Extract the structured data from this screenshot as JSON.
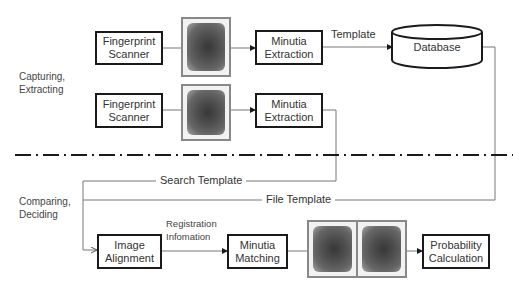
{
  "sections": {
    "top": {
      "label": "Capturing,\nExtracting"
    },
    "bottom": {
      "label": "Comparing,\nDeciding"
    }
  },
  "nodes": {
    "scanner1": "Fingerprint\nScanner",
    "scanner2": "Fingerprint\nScanner",
    "minutia_extraction1": "Minutia\nExtraction",
    "minutia_extraction2": "Minutia\nExtraction",
    "database": "Database",
    "image_alignment": "Image\nAlignment",
    "minutia_matching": "Minutia\nMatching",
    "probability_calculation": "Probability\nCalculation"
  },
  "edges": {
    "template": "Template",
    "search_template": "Search Template",
    "file_template": "File Template",
    "registration_information": "Registration\nInfomation"
  },
  "images": {
    "fingerprint_1": "fingerprint-image",
    "fingerprint_2": "fingerprint-image",
    "fingerprint_pair": "fingerprint-pair-image"
  },
  "colors": {
    "box_border": "#1a1a1a",
    "line": "#777777",
    "divider": "#1a1a1a"
  }
}
